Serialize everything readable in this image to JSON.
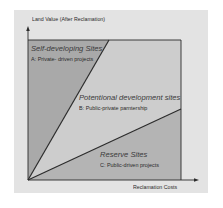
{
  "diagram": {
    "y_axis_label": "Land Value (After Reclamation)",
    "x_axis_label": "Reclamation Costs",
    "regions": [
      {
        "title": "Self-developing Sites",
        "subtitle": "A: Private- driven projects",
        "fill": "#a9a9a9"
      },
      {
        "title": "Potentional development sites",
        "subtitle": "B: Public-private parntership",
        "fill": "#cdcdcd"
      },
      {
        "title": "Reserve Sites",
        "subtitle": "C: Public-driven projects",
        "fill": "#b4b4b4"
      }
    ],
    "colors": {
      "panel": "#e3e3e3",
      "lines": "#2b2b2b"
    }
  }
}
